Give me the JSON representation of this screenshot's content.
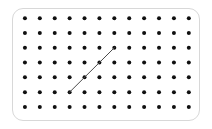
{
  "canvas": {
    "width": 212,
    "height": 129,
    "background_color": "#ffffff"
  },
  "card": {
    "label": "dot-grid-card",
    "x": 12,
    "y": 8,
    "width": 188,
    "height": 113,
    "background_color": "#ffffff",
    "border_color": "#d8d8d8",
    "border_radius": 11
  },
  "grid": {
    "label": "dot-grid",
    "columns": 12,
    "rows": 7,
    "origin_x": 12,
    "origin_y": 9,
    "spacing_x": 14.9,
    "spacing_y": 14.8,
    "dot_radius": 2,
    "dot_color": "#101010"
  },
  "segment": {
    "label": "diagonal-segment",
    "start_col": 3,
    "start_row": 5,
    "end_col": 6,
    "end_row": 2,
    "delta_columns": 3,
    "delta_rows": -3,
    "slope": 1,
    "stroke_color": "#4a4a4a",
    "stroke_width": 1
  }
}
